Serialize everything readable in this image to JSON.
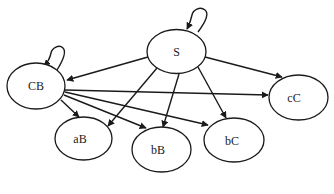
{
  "diagram": {
    "type": "directed-graph",
    "colors": {
      "stroke": "#1a1a1a",
      "fill": "#ffffff",
      "background": "#ffffff"
    },
    "nodes": [
      {
        "id": "S",
        "label": "S",
        "cx": 176.5,
        "cy": 51.5,
        "rx": 29.5,
        "ry": 22
      },
      {
        "id": "CB",
        "label": "CB",
        "cx": 36,
        "cy": 86,
        "rx": 29,
        "ry": 23
      },
      {
        "id": "aB",
        "label": "aB",
        "cx": 83.5,
        "cy": 138.5,
        "rx": 28.5,
        "ry": 21.5
      },
      {
        "id": "bB",
        "label": "bB",
        "cx": 161.5,
        "cy": 149.5,
        "rx": 29.5,
        "ry": 22.5
      },
      {
        "id": "bC",
        "label": "bC",
        "cx": 234,
        "cy": 140,
        "rx": 30,
        "ry": 22
      },
      {
        "id": "cC",
        "label": "cC",
        "cx": 298.5,
        "cy": 97.5,
        "rx": 29.5,
        "ry": 22.5
      }
    ],
    "edges": [
      {
        "from": "S",
        "to": "S"
      },
      {
        "from": "S",
        "to": "CB"
      },
      {
        "from": "S",
        "to": "aB"
      },
      {
        "from": "S",
        "to": "bB"
      },
      {
        "from": "S",
        "to": "bC"
      },
      {
        "from": "S",
        "to": "cC"
      },
      {
        "from": "CB",
        "to": "CB"
      },
      {
        "from": "CB",
        "to": "aB"
      },
      {
        "from": "CB",
        "to": "bB"
      },
      {
        "from": "CB",
        "to": "bC"
      },
      {
        "from": "CB",
        "to": "cC"
      }
    ]
  }
}
